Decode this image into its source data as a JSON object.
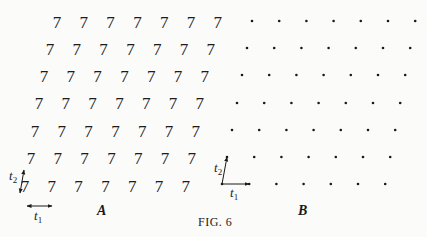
{
  "figure": {
    "caption": "Fig. 6",
    "caption_display": "FIG. 6",
    "panels": [
      {
        "label": "A",
        "motif": "7",
        "rows": 7,
        "cols": 7,
        "row_y": [
          22,
          49,
          76,
          103,
          131,
          158,
          186
        ],
        "row_x_start": [
          57,
          50,
          44,
          39,
          35,
          31,
          25
        ],
        "col_spacing": 26.8,
        "vectors": {
          "t1": "t",
          "t1_sub": "1",
          "t2": "t",
          "t2_sub": "2"
        }
      },
      {
        "label": "B",
        "motif": "point",
        "rows": 7,
        "cols": 7,
        "row_y": [
          21,
          48,
          75,
          103,
          130,
          157,
          184
        ],
        "row_x_start": [
          252,
          247,
          242,
          237,
          232,
          227,
          222
        ],
        "col_spacing": 27.2,
        "vectors": {
          "t1": "t",
          "t1_sub": "1",
          "t2": "t",
          "t2_sub": "2"
        }
      }
    ]
  }
}
